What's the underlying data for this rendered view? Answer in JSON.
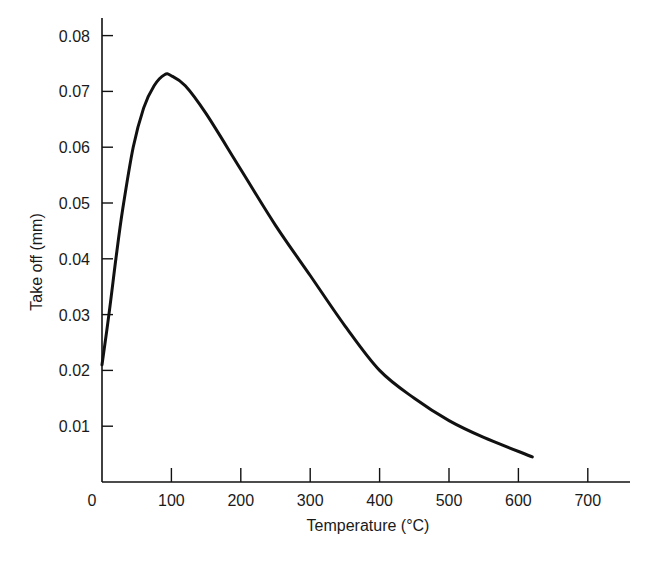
{
  "chart_data": {
    "type": "line",
    "title": "",
    "xlabel": "Temperature (°C)",
    "ylabel": "Take off (mm)",
    "xlim": [
      0,
      750
    ],
    "ylim": [
      0,
      0.085
    ],
    "grid": false,
    "legend": null,
    "x_ticks": [
      "0",
      "100",
      "200",
      "300",
      "400",
      "500",
      "600",
      "700"
    ],
    "y_ticks": [
      "0.01",
      "0.02",
      "0.03",
      "0.04",
      "0.05",
      "0.06",
      "0.07",
      "0.08"
    ],
    "series": [
      {
        "name": "Take off",
        "x": [
          0,
          10,
          20,
          30,
          45,
          60,
          75,
          90,
          100,
          120,
          150,
          200,
          250,
          300,
          350,
          400,
          450,
          500,
          550,
          620
        ],
        "values": [
          0.021,
          0.03,
          0.04,
          0.049,
          0.06,
          0.067,
          0.071,
          0.073,
          0.0728,
          0.071,
          0.066,
          0.056,
          0.046,
          0.037,
          0.028,
          0.02,
          0.015,
          0.011,
          0.008,
          0.0045
        ]
      }
    ]
  },
  "axes": {
    "xlabel": "Temperature (°C)",
    "ylabel": "Take off (mm)"
  }
}
